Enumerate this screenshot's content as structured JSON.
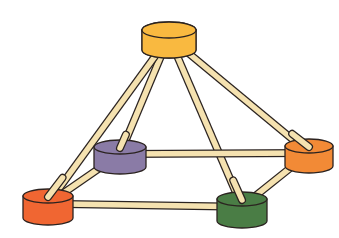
{
  "diagram": {
    "type": "network-topology",
    "rod_color": "#f5e2b0",
    "outline_color": "#2b2320",
    "nodes": [
      {
        "id": "top",
        "name": "yellow-node",
        "color": "#f9b940",
        "cx": 169,
        "cy": 30,
        "rx": 27,
        "ry": 8,
        "h": 20
      },
      {
        "id": "purple",
        "name": "purple-node",
        "color": "#8a7ba6",
        "cx": 120,
        "cy": 147,
        "rx": 26,
        "ry": 7,
        "h": 20
      },
      {
        "id": "orange",
        "name": "orange-node",
        "color": "#f28a36",
        "cx": 309,
        "cy": 146,
        "rx": 24,
        "ry": 7,
        "h": 20
      },
      {
        "id": "red",
        "name": "red-orange-node",
        "color": "#f06632",
        "cx": 48,
        "cy": 196,
        "rx": 25,
        "ry": 7,
        "h": 22
      },
      {
        "id": "green",
        "name": "green-node",
        "color": "#4a7d45",
        "cx": 242,
        "cy": 199,
        "rx": 25,
        "ry": 7,
        "h": 22
      }
    ],
    "edges": [
      {
        "from": "top",
        "to": "purple"
      },
      {
        "from": "top",
        "to": "red"
      },
      {
        "from": "top",
        "to": "green"
      },
      {
        "from": "top",
        "to": "orange"
      },
      {
        "from": "purple",
        "to": "orange"
      },
      {
        "from": "purple",
        "to": "red"
      },
      {
        "from": "red",
        "to": "green"
      },
      {
        "from": "green",
        "to": "orange"
      }
    ]
  }
}
